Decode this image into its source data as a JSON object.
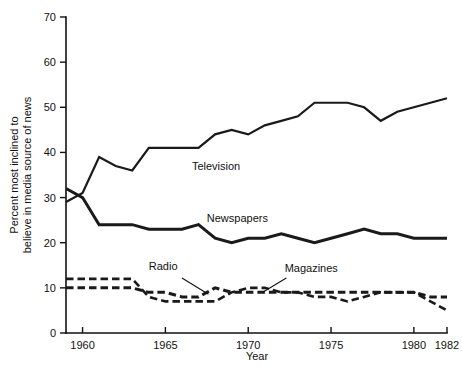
{
  "chart_data": {
    "type": "line",
    "title": "",
    "xlabel": "Year",
    "ylabel_line1": "Percent most inclined to",
    "ylabel_line2": "believe in media source of news",
    "xlim": [
      1959,
      1982
    ],
    "ylim": [
      0,
      70
    ],
    "xticks": [
      1960,
      1965,
      1970,
      1975,
      1980,
      1982
    ],
    "xtick_labels": [
      "1960",
      "1965",
      "1970",
      "1975",
      "1980",
      "1982"
    ],
    "yticks": [
      0,
      10,
      20,
      30,
      40,
      50,
      60,
      70
    ],
    "ytick_labels": [
      "0",
      "10",
      "20",
      "30",
      "40",
      "50",
      "60",
      "70"
    ],
    "grid": false,
    "legend_position": "inline-annotations",
    "x": [
      1959,
      1960,
      1961,
      1962,
      1963,
      1964,
      1965,
      1966,
      1967,
      1968,
      1969,
      1970,
      1971,
      1972,
      1973,
      1974,
      1975,
      1976,
      1977,
      1978,
      1979,
      1980,
      1981,
      1982
    ],
    "series": [
      {
        "name": "Television",
        "style": "solid",
        "stroke_width": 2.2,
        "color": "#3a3a3a",
        "label_x": 1966.6,
        "label_y": 36.0,
        "values": [
          29,
          31,
          39,
          37,
          36,
          41,
          41,
          41,
          41,
          44,
          45,
          44,
          46,
          47,
          48,
          51,
          51,
          51,
          50,
          47,
          49,
          50,
          51,
          52
        ]
      },
      {
        "name": "Newspapers",
        "style": "solid",
        "stroke_width": 3.0,
        "color": "#111111",
        "label_x": 1967.5,
        "label_y": 24.5,
        "values": [
          32,
          30,
          24,
          24,
          24,
          23,
          23,
          23,
          24,
          21,
          20,
          21,
          21,
          22,
          21,
          20,
          21,
          22,
          23,
          22,
          22,
          21,
          21,
          21
        ]
      },
      {
        "name": "Magazines",
        "style": "dashed",
        "stroke_width": 2.6,
        "color": "#3a3a3a",
        "label_x": 1972.2,
        "label_y": 13.5,
        "values": [
          12,
          12,
          12,
          12,
          12,
          8,
          7,
          7,
          7,
          7,
          9,
          10,
          10,
          9,
          9,
          8,
          8,
          7,
          8,
          9,
          9,
          9,
          7,
          5
        ]
      },
      {
        "name": "Radio",
        "style": "dashed",
        "stroke_width": 3.0,
        "color": "#111111",
        "label_x": 1964.0,
        "label_y": 14.0,
        "values": [
          10,
          10,
          10,
          10,
          10,
          9,
          9,
          8,
          8,
          10,
          9,
          9,
          9,
          9,
          9,
          9,
          9,
          9,
          9,
          9,
          9,
          9,
          8,
          8
        ]
      }
    ],
    "annotations": [
      {
        "name": "radio-leader",
        "from_x": 1966.0,
        "from_y": 12.2,
        "to_x": 1967.6,
        "to_y": 8.6
      },
      {
        "name": "magazines-leader",
        "from_x": 1972.3,
        "from_y": 12.2,
        "to_x": 1970.9,
        "to_y": 9.1
      }
    ]
  }
}
